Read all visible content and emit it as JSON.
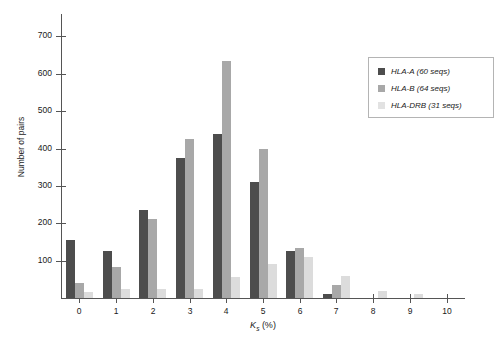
{
  "chart_data": {
    "type": "bar",
    "title": "",
    "xlabel": "Ks (%)",
    "xlabel_main": "K",
    "xlabel_sub": "s",
    "xlabel_unit": " (%)",
    "ylabel": "Number of pairs",
    "categories": [
      "0",
      "1",
      "2",
      "3",
      "4",
      "5",
      "6",
      "7",
      "8",
      "9",
      "10"
    ],
    "ylim": [
      0,
      760
    ],
    "xlim": [
      0,
      10
    ],
    "yticks": [
      100,
      200,
      300,
      400,
      500,
      600,
      700
    ],
    "ytick_labels": [
      "100",
      "200",
      "300",
      "400",
      "500",
      "600",
      "700"
    ],
    "grid": false,
    "legend_position": "top-right",
    "series": [
      {
        "name": "HLA-A (60 seqs)",
        "color": "#4d4d4d",
        "values": [
          155,
          125,
          235,
          375,
          440,
          310,
          125,
          10,
          0,
          0,
          0
        ]
      },
      {
        "name": "HLA-B (64 seqs)",
        "color": "#a8a8a8",
        "values": [
          40,
          82,
          212,
          425,
          635,
          400,
          135,
          35,
          0,
          0,
          0
        ]
      },
      {
        "name": "HLA-DRB (31 seqs)",
        "color": "#dcdcdc",
        "values": [
          15,
          25,
          25,
          25,
          55,
          90,
          110,
          60,
          18,
          10,
          0
        ]
      }
    ]
  },
  "legend": {
    "items": [
      {
        "label": "HLA-A (60 seqs)"
      },
      {
        "label": "HLA-B (64 seqs)"
      },
      {
        "label": "HLA-DRB (31 seqs)"
      }
    ]
  }
}
